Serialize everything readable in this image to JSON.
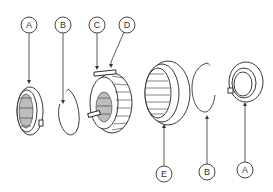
{
  "diagram": {
    "type": "exploded-view",
    "callouts": [
      {
        "id": "top-a",
        "letter": "A",
        "cx": 29,
        "cy": 25
      },
      {
        "id": "top-b",
        "letter": "B",
        "cx": 63,
        "cy": 25
      },
      {
        "id": "top-c",
        "letter": "C",
        "cx": 97,
        "cy": 25
      },
      {
        "id": "top-d",
        "letter": "D",
        "cx": 127,
        "cy": 25
      },
      {
        "id": "bottom-e",
        "letter": "E",
        "cx": 164,
        "cy": 174
      },
      {
        "id": "bottom-b",
        "letter": "B",
        "cx": 207,
        "cy": 172
      },
      {
        "id": "bottom-a",
        "letter": "A",
        "cx": 245,
        "cy": 170
      }
    ],
    "parts": [
      {
        "name": "blocker-ring-left",
        "label": "A"
      },
      {
        "name": "snap-ring-left",
        "label": "B"
      },
      {
        "name": "synchronizer-hub",
        "label": "C"
      },
      {
        "name": "key-insert",
        "label": "D"
      },
      {
        "name": "sleeve",
        "label": "E"
      },
      {
        "name": "snap-ring-right",
        "label": "B"
      },
      {
        "name": "blocker-ring-right",
        "label": "A"
      }
    ],
    "colors": {
      "line": "#222222",
      "shade": "#bdbdbd",
      "background": "#ffffff"
    }
  }
}
